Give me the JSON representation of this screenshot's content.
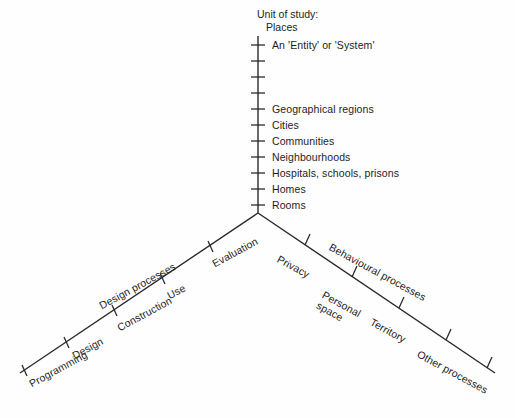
{
  "diagram": {
    "title_lines": [
      "Unit of study:",
      "Places"
    ],
    "vertical_axis": {
      "name": "unit-of-study-axis",
      "items": [
        "An 'Entity' or 'System'",
        "",
        "",
        "",
        "Geographical regions",
        "Cities",
        "Communities",
        "Neighbourhoods",
        "Hospitals, schools, prisons",
        "Homes",
        "Rooms"
      ]
    },
    "left_axis": {
      "name": "design-processes-axis",
      "arm_label": "Design processes",
      "items": [
        "Programming",
        "Design",
        "Construction",
        "Use",
        "Evaluation"
      ]
    },
    "right_axis": {
      "name": "behavioural-processes-axis",
      "arm_label": "Behavioural processes",
      "items": [
        "Privacy",
        "Personal space",
        "Territory",
        "Other processes"
      ]
    },
    "colors": {
      "line": "#2a2a2a",
      "text": "#1d1d1d",
      "background": "#fefefe"
    }
  }
}
